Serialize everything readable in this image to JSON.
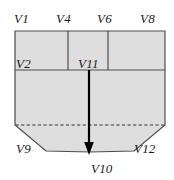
{
  "figure": {
    "type": "diagram",
    "colors": {
      "fill": "#dedede",
      "stroke": "#4d4d4d",
      "arrow": "#000000",
      "dashed": "#333333",
      "text": "#1a1a1a",
      "background": "#ffffff"
    },
    "shape": {
      "outline_points": "15,31 165,31 165,125 134,151 90,152 46,151 15,125",
      "dashed_line": {
        "x1": 15,
        "y1": 125,
        "x2": 165,
        "y2": 125
      },
      "interior_lines": [
        {
          "name": "horizontal-divider",
          "x1": 15,
          "y1": 70,
          "x2": 165,
          "y2": 70
        },
        {
          "name": "vertical-divider-left",
          "x1": 68,
          "y1": 31,
          "x2": 68,
          "y2": 70
        },
        {
          "name": "vertical-divider-right",
          "x1": 108,
          "y1": 31,
          "x2": 108,
          "y2": 70
        }
      ],
      "arrow": {
        "x": 89,
        "y1": 70,
        "y2": 152
      }
    },
    "labels": [
      {
        "id": "V1",
        "text": "V1",
        "x": 14,
        "y": 12
      },
      {
        "id": "V4",
        "text": "V4",
        "x": 56,
        "y": 12
      },
      {
        "id": "V6",
        "text": "V6",
        "x": 97,
        "y": 12
      },
      {
        "id": "V8",
        "text": "V8",
        "x": 140,
        "y": 12
      },
      {
        "id": "V2",
        "text": "V2",
        "x": 16,
        "y": 57
      },
      {
        "id": "V11",
        "text": "V11",
        "x": 78,
        "y": 57
      },
      {
        "id": "V9",
        "text": "V9",
        "x": 16,
        "y": 142
      },
      {
        "id": "V12",
        "text": "V12",
        "x": 134,
        "y": 142
      },
      {
        "id": "V10",
        "text": "V10",
        "x": 91,
        "y": 162
      }
    ]
  }
}
